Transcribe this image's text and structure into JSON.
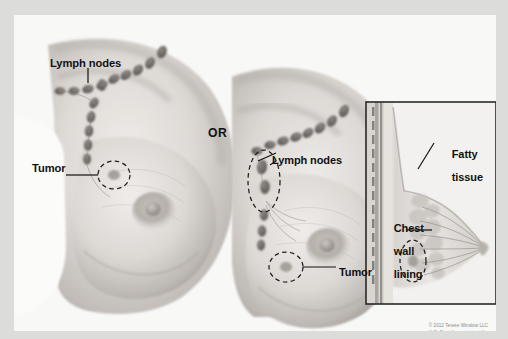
{
  "figure": {
    "background_color": "#f8f8f7",
    "paper_color": "#dcdcda"
  },
  "connector": {
    "label": "OR"
  },
  "panels": {
    "left": {
      "name": "left-breast-illustration",
      "labels": {
        "lymph_nodes": "Lymph nodes",
        "tumor": "Tumor"
      }
    },
    "right": {
      "name": "right-breast-illustration",
      "labels": {
        "lymph_nodes": "Lymph nodes",
        "tumor": "Tumor"
      }
    },
    "inset": {
      "name": "breast-cross-section-inset",
      "border_color": "#2a2a2a",
      "labels": {
        "fatty_tissue_line1": "Fatty",
        "fatty_tissue_line2": "tissue",
        "chest_wall_line1": "Chest",
        "chest_wall_line2": "wall",
        "chest_wall_line3": "lining"
      }
    }
  },
  "credit": {
    "line1": "© 2012 Terese Winslow LLC",
    "line2": "U.S. Govt. has certain rights"
  },
  "colors": {
    "ink": "#111111",
    "skin_light": "#e7e4e1",
    "skin_mid": "#cfcac6",
    "skin_shadow": "#a9a4a0",
    "node": "#6f6b68",
    "credit_grey": "#8a8a8a"
  }
}
